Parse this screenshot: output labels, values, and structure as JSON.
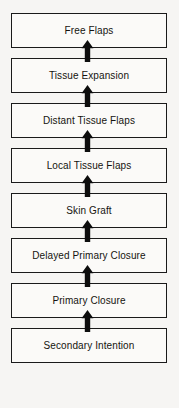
{
  "diagram": {
    "type": "vertical-flow-ladder",
    "direction": "bottom-to-top",
    "arrow_icon": "up-arrow-icon",
    "colors": {
      "background": "#f6f5f3",
      "box_fill": "#fbfaf8",
      "box_border": "#1a1a1a",
      "text": "#15140f",
      "arrow": "#0d0d0d"
    },
    "steps": [
      {
        "label": "Free Flaps"
      },
      {
        "label": "Tissue Expansion"
      },
      {
        "label": "Distant Tissue Flaps"
      },
      {
        "label": "Local Tissue Flaps"
      },
      {
        "label": "Skin Graft"
      },
      {
        "label": "Delayed Primary Closure"
      },
      {
        "label": "Primary Closure"
      },
      {
        "label": "Secondary Intention"
      }
    ]
  }
}
